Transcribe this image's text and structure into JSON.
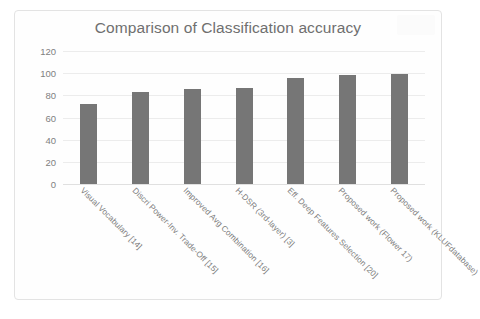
{
  "chart_data": {
    "type": "bar",
    "title": "Comparison of Classification accuracy",
    "xlabel": "",
    "ylabel": "",
    "ylim": [
      0,
      120
    ],
    "yticks": [
      0,
      20,
      40,
      60,
      80,
      100,
      120
    ],
    "grid": true,
    "legend": false,
    "bar_color": "#767676",
    "categories": [
      "Visual Vocabulary [14]",
      "Discri Power-Inv. Trade-Off [15]",
      "Improved Avg Combination [16]",
      "H-DSR (3rd-layer) [3]",
      "Eff. Deep Features Selection [20]",
      "Proposed work (Flower 17)",
      "Proposed work (KLUFdatabase)"
    ],
    "values": [
      72,
      83,
      86,
      87,
      96,
      98,
      99
    ]
  }
}
